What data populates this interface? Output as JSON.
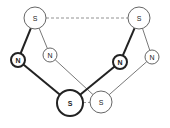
{
  "diagram": {
    "width": 170,
    "height": 128,
    "colors": {
      "background": "#ffffff",
      "stroke_thick": "#222222",
      "stroke_thin": "#555555",
      "node_fill": "#ffffff",
      "dashed": "#777777"
    },
    "nodes": [
      {
        "id": "s_top_left",
        "label": "S",
        "cx": 35,
        "cy": 18,
        "r": 11,
        "weight": "thin"
      },
      {
        "id": "s_top_right",
        "label": "S",
        "cx": 139,
        "cy": 18,
        "r": 11,
        "weight": "thin"
      },
      {
        "id": "n_left_thick",
        "label": "N",
        "cx": 18,
        "cy": 60,
        "r": 7,
        "weight": "thick"
      },
      {
        "id": "n_left_thin",
        "label": "N",
        "cx": 50,
        "cy": 55,
        "r": 7,
        "weight": "thin"
      },
      {
        "id": "n_right_thick",
        "label": "N",
        "cx": 120,
        "cy": 62,
        "r": 7,
        "weight": "thick"
      },
      {
        "id": "n_right_thin",
        "label": "N",
        "cx": 152,
        "cy": 57,
        "r": 7,
        "weight": "thin"
      },
      {
        "id": "s_bottom_thick",
        "label": "S",
        "cx": 70,
        "cy": 103,
        "r": 13,
        "weight": "thick"
      },
      {
        "id": "s_bottom_thin",
        "label": "S",
        "cx": 101,
        "cy": 102,
        "r": 11,
        "weight": "thin"
      }
    ],
    "edges": [
      {
        "from": "s_top_left",
        "to": "s_top_right",
        "style": "dashed"
      },
      {
        "from": "s_top_left",
        "to": "n_left_thick",
        "style": "thick"
      },
      {
        "from": "s_top_left",
        "to": "n_left_thin",
        "style": "thin"
      },
      {
        "from": "n_left_thick",
        "to": "s_bottom_thick",
        "style": "thick"
      },
      {
        "from": "n_left_thin",
        "to": "s_bottom_thin",
        "style": "thin"
      },
      {
        "from": "s_top_right",
        "to": "n_right_thick",
        "style": "thick"
      },
      {
        "from": "s_top_right",
        "to": "n_right_thin",
        "style": "thin"
      },
      {
        "from": "n_right_thick",
        "to": "s_bottom_thick",
        "style": "thick"
      },
      {
        "from": "n_right_thin",
        "to": "s_bottom_thin",
        "style": "thin"
      },
      {
        "from": "s_bottom_thick",
        "to": "s_bottom_thin",
        "style": "dashed"
      }
    ]
  }
}
